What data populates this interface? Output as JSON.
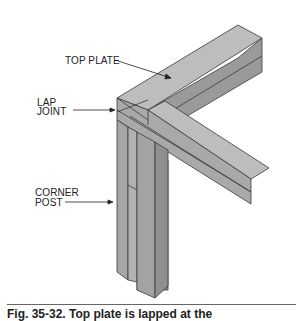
{
  "figure": {
    "labels": {
      "top_plate": "TOP PLATE",
      "lap_joint_line1": "LAP",
      "lap_joint_line2": "JOINT",
      "corner_post_line1": "CORNER",
      "corner_post_line2": "POST"
    },
    "caption": "Fig. 35-32. Top plate is lapped at the",
    "colors": {
      "top_face": "#b9b9b9",
      "side_face": "#9d9d9d",
      "dark_face": "#8a8a8a",
      "outline": "#3a3a3a"
    }
  }
}
